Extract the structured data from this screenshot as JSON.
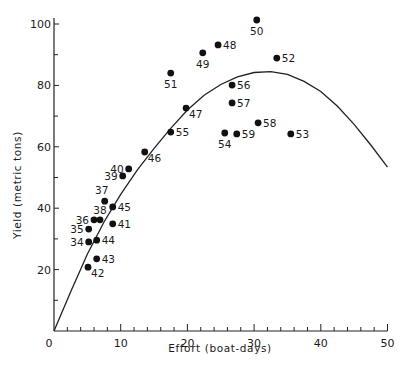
{
  "chart_data": {
    "type": "scatter",
    "title": "",
    "xlabel": "Effort (boat-days)",
    "ylabel": "Yield (metric tons)",
    "xlim": [
      0,
      50
    ],
    "ylim": [
      0,
      100
    ],
    "x_ticks": [
      0,
      10,
      20,
      30,
      40,
      50
    ],
    "x_minor_step": 2,
    "y_ticks": [
      20,
      40,
      60,
      80,
      100
    ],
    "y_minor_step": 10,
    "grid": false,
    "legend": null,
    "point_color": "#111111",
    "curve_color": "#222222",
    "series": [
      {
        "name": "Observed yield by year",
        "type": "scatter",
        "points": [
          {
            "label": "34",
            "x": 5.2,
            "y": 29.0,
            "label_pos": "left"
          },
          {
            "label": "35",
            "x": 5.2,
            "y": 33.2,
            "label_pos": "left"
          },
          {
            "label": "36",
            "x": 6.0,
            "y": 36.2,
            "label_pos": "left"
          },
          {
            "label": "37",
            "x": 7.6,
            "y": 42.3,
            "label_pos": "above-left"
          },
          {
            "label": "38",
            "x": 6.9,
            "y": 36.2,
            "label_pos": "above"
          },
          {
            "label": "39",
            "x": 10.3,
            "y": 50.5,
            "label_pos": "left"
          },
          {
            "label": "40",
            "x": 11.2,
            "y": 52.8,
            "label_pos": "left"
          },
          {
            "label": "41",
            "x": 8.8,
            "y": 34.9,
            "label_pos": "right"
          },
          {
            "label": "42",
            "x": 5.1,
            "y": 20.8,
            "label_pos": "below-right"
          },
          {
            "label": "43",
            "x": 6.4,
            "y": 23.5,
            "label_pos": "right"
          },
          {
            "label": "44",
            "x": 6.4,
            "y": 29.6,
            "label_pos": "right"
          },
          {
            "label": "45",
            "x": 8.8,
            "y": 40.4,
            "label_pos": "right"
          },
          {
            "label": "46",
            "x": 13.6,
            "y": 58.3,
            "label_pos": "below-right"
          },
          {
            "label": "47",
            "x": 19.8,
            "y": 72.6,
            "label_pos": "below-right"
          },
          {
            "label": "48",
            "x": 24.6,
            "y": 93.2,
            "label_pos": "right"
          },
          {
            "label": "49",
            "x": 22.3,
            "y": 90.6,
            "label_pos": "below"
          },
          {
            "label": "50",
            "x": 30.4,
            "y": 101.3,
            "label_pos": "below"
          },
          {
            "label": "51",
            "x": 17.5,
            "y": 84.0,
            "label_pos": "below"
          },
          {
            "label": "52",
            "x": 33.4,
            "y": 88.9,
            "label_pos": "right"
          },
          {
            "label": "53",
            "x": 35.5,
            "y": 64.2,
            "label_pos": "right"
          },
          {
            "label": "54",
            "x": 25.6,
            "y": 64.5,
            "label_pos": "below"
          },
          {
            "label": "55",
            "x": 17.5,
            "y": 64.8,
            "label_pos": "right"
          },
          {
            "label": "56",
            "x": 26.7,
            "y": 80.1,
            "label_pos": "right"
          },
          {
            "label": "57",
            "x": 26.7,
            "y": 74.3,
            "label_pos": "right"
          },
          {
            "label": "58",
            "x": 30.6,
            "y": 67.8,
            "label_pos": "right"
          },
          {
            "label": "59",
            "x": 27.4,
            "y": 64.2,
            "label_pos": "right"
          }
        ]
      },
      {
        "name": "Fitted yield-effort curve",
        "type": "line",
        "x": [
          0,
          2.5,
          5,
          7.5,
          10,
          12.5,
          15,
          17.5,
          20,
          22.5,
          25,
          27.5,
          30,
          32.5,
          35,
          37.5,
          40,
          42.5,
          45,
          47.5,
          50
        ],
        "y": [
          0,
          12.8,
          25.0,
          35.5,
          44.5,
          52.5,
          59.5,
          66.0,
          72.0,
          76.8,
          80.3,
          82.8,
          84.2,
          84.5,
          83.6,
          81.3,
          78.0,
          73.2,
          67.3,
          60.6,
          53.4
        ]
      }
    ]
  }
}
